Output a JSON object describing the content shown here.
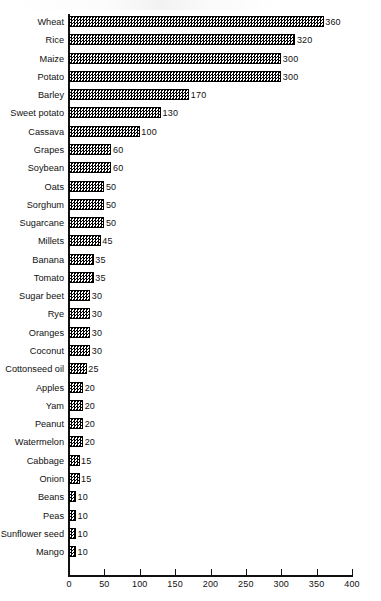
{
  "chart_data": {
    "type": "bar",
    "orientation": "horizontal",
    "title": "",
    "subtitle": "",
    "xlabel": "",
    "ylabel": "",
    "xlim": [
      0,
      400
    ],
    "grid": false,
    "legend": null,
    "x_ticks": [
      0,
      50,
      100,
      150,
      200,
      250,
      300,
      350,
      400
    ],
    "x_tick_labels": [
      "0",
      "50",
      "100",
      "150",
      "200",
      "250",
      "300",
      "350",
      "400"
    ],
    "value_labels_shown": true,
    "bar_fill": "checkerboard-hatch",
    "bar_edge_color": "#000000",
    "categories": [
      "Wheat",
      "Rice",
      "Maize",
      "Potato",
      "Barley",
      "Sweet potato",
      "Cassava",
      "Grapes",
      "Soybean",
      "Oats",
      "Sorghum",
      "Sugarcane",
      "Millets",
      "Banana",
      "Tomato",
      "Sugar beet",
      "Rye",
      "Oranges",
      "Coconut",
      "Cottonseed oil",
      "Apples",
      "Yam",
      "Peanut",
      "Watermelon",
      "Cabbage",
      "Onion",
      "Beans",
      "Peas",
      "Sunflower seed",
      "Mango"
    ],
    "values": [
      360,
      320,
      300,
      300,
      170,
      130,
      100,
      60,
      60,
      50,
      50,
      50,
      45,
      35,
      35,
      30,
      30,
      30,
      30,
      25,
      20,
      20,
      20,
      20,
      15,
      15,
      10,
      10,
      10,
      10
    ],
    "value_text": [
      "360",
      "320",
      "300",
      "300",
      "170",
      "130",
      "100",
      "60",
      "60",
      "50",
      "50",
      "50",
      "45",
      "35",
      "35",
      "30",
      "30",
      "30",
      "30",
      "25",
      "20",
      "20",
      "20",
      "20",
      "15",
      "15",
      "10",
      "10",
      "10",
      "10"
    ]
  }
}
